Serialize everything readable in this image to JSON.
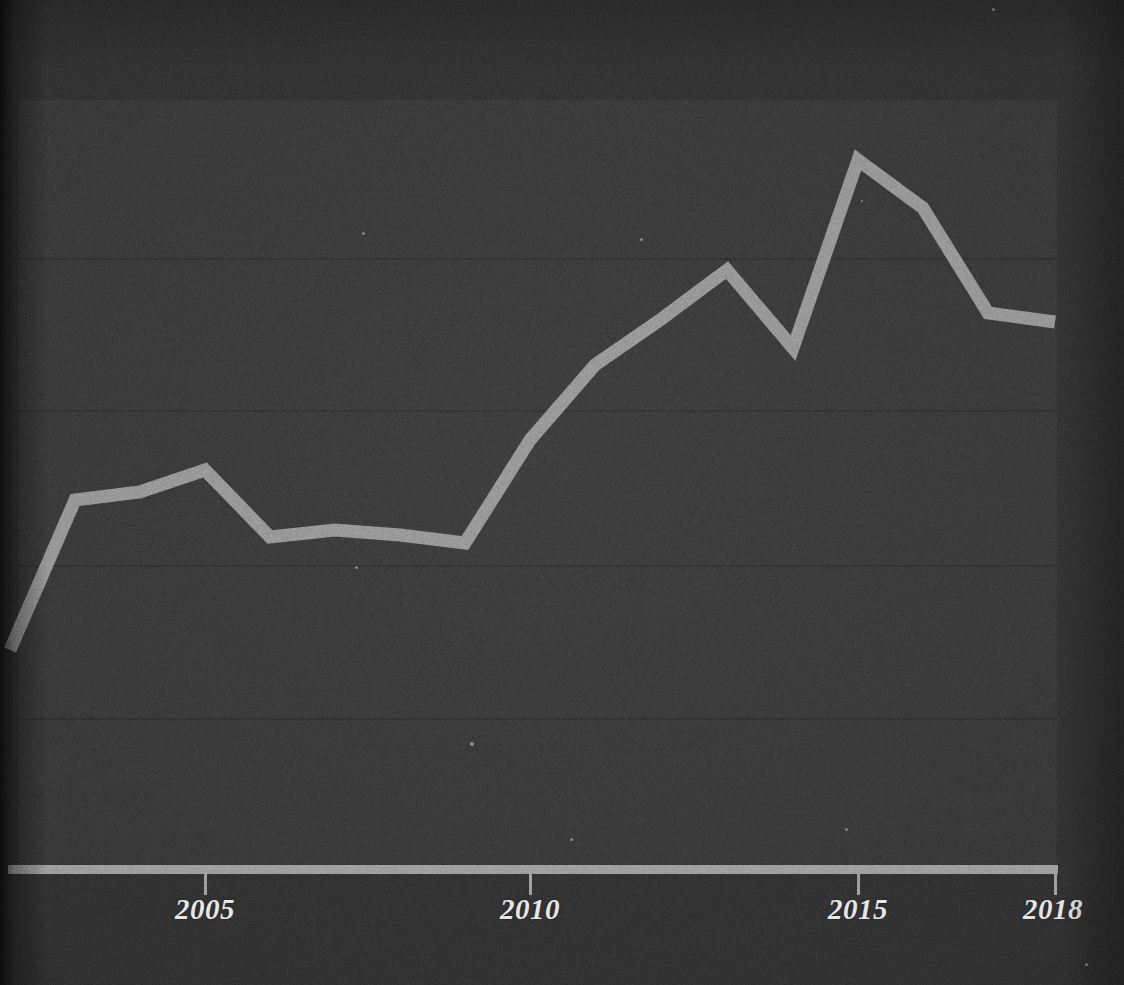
{
  "chart_data": {
    "type": "line",
    "title": "",
    "subtitle": "",
    "xlabel": "",
    "ylabel": "",
    "grid": true,
    "legend": "none",
    "xlim": [
      2002,
      2018
    ],
    "ylim": [
      0,
      100
    ],
    "x": [
      2002,
      2003,
      2004,
      2005,
      2006,
      2007,
      2008,
      2009,
      2010,
      2011,
      2012,
      2013,
      2014,
      2015,
      2016,
      2017,
      2018
    ],
    "x_tick_labels": [
      "2005",
      "2010",
      "2015",
      "2018"
    ],
    "x_tick_values": [
      2005,
      2010,
      2015,
      2018
    ],
    "y_gridline_values": [
      80,
      60,
      40,
      20
    ],
    "series": [
      {
        "name": "value",
        "color": "#9a9a9a",
        "values": [
          28.5,
          44.5,
          50.5,
          53.5,
          44.5,
          45.0,
          44.5,
          43.5,
          56.5,
          66.0,
          71.0,
          77.5,
          67.5,
          92.0,
          86.5,
          73.5,
          72.5
        ]
      }
    ],
    "pixel_points": [
      [
        10,
        650
      ],
      [
        75,
        500
      ],
      [
        140,
        492
      ],
      [
        205,
        470
      ],
      [
        270,
        537
      ],
      [
        335,
        530
      ],
      [
        400,
        535
      ],
      [
        465,
        543
      ],
      [
        530,
        440
      ],
      [
        595,
        365
      ],
      [
        660,
        320
      ],
      [
        727,
        270
      ],
      [
        793,
        348
      ],
      [
        858,
        160
      ],
      [
        923,
        208
      ],
      [
        988,
        313
      ],
      [
        1055,
        322
      ]
    ]
  },
  "axis": {
    "line_color": "#a2a2a2",
    "tick_color": "#a3a3a3",
    "label_color": "#e8e8e8"
  },
  "panel": {
    "background_color": "#3a3a3a",
    "gridline_color": "#313131",
    "page_background_color": "#333333"
  },
  "ticks": [
    {
      "label": "2005",
      "x": 205
    },
    {
      "label": "2010",
      "x": 530
    },
    {
      "label": "2015",
      "x": 858
    },
    {
      "label": "2018",
      "x": 1055
    }
  ],
  "gridlines": [
    {
      "y": 258
    },
    {
      "y": 410
    },
    {
      "y": 565
    },
    {
      "y": 718
    }
  ]
}
